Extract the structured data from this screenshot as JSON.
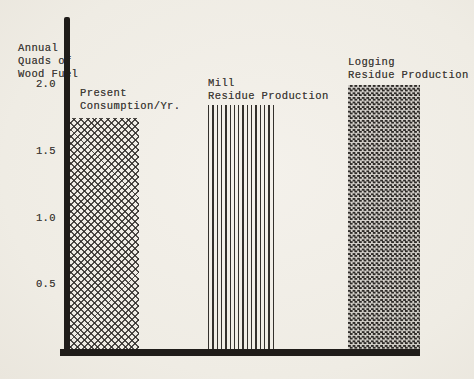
{
  "colors": {
    "paper": "#f1eee7",
    "ink": "#403c38",
    "axis": "#1f1c19",
    "pattern_ink": "#2e2b28"
  },
  "chart_data": {
    "type": "bar",
    "title": "",
    "ylabel": "Annual Quads of Wood Fuel",
    "ylabel_lines": [
      "Annual",
      "Quads of",
      "Wood Fuel"
    ],
    "xlabel": "",
    "yticks": [
      "2.0",
      "1.5",
      "1.0",
      "0.5"
    ],
    "ylim": [
      0,
      2.5
    ],
    "grid": false,
    "legend": "none",
    "categories": [
      "Present Consumption/Yr.",
      "Mill Residue Production",
      "Logging Residue Production"
    ],
    "values": [
      1.75,
      1.85,
      2.0
    ],
    "bars": [
      {
        "name": "present-consumption",
        "label_lines": [
          "Present",
          "Consumption/Yr."
        ],
        "value": 1.75,
        "pattern": "diagonal-crosshatch"
      },
      {
        "name": "mill-residue-production",
        "label_lines": [
          "Mill",
          "Residue Production"
        ],
        "value": 1.85,
        "pattern": "vertical-lines"
      },
      {
        "name": "logging-residue-production",
        "label_lines": [
          "Logging",
          "Residue Production"
        ],
        "value": 2.0,
        "pattern": "fine-checkerboard"
      }
    ],
    "geometry": {
      "baseline_y": 352,
      "px_per_unit": 133.5
    }
  }
}
